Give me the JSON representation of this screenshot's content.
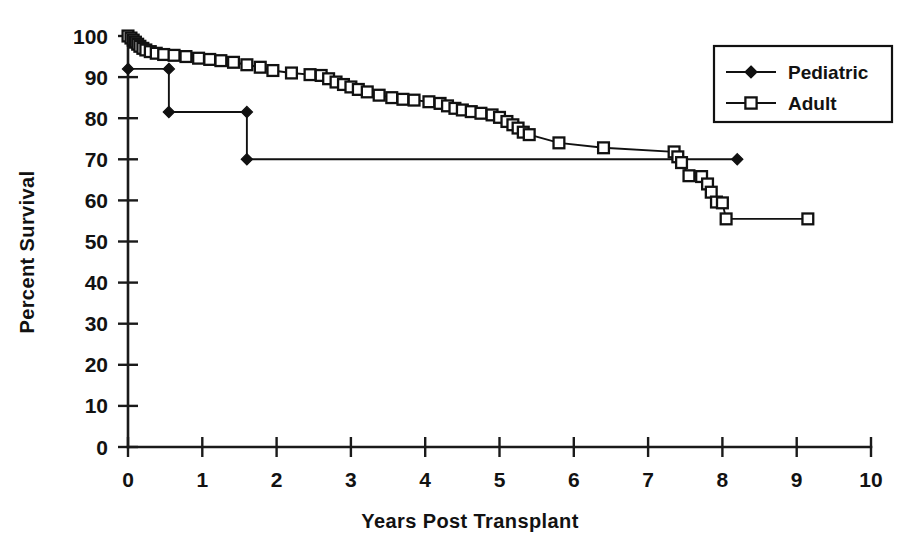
{
  "chart_data": {
    "type": "line",
    "title": "",
    "subtitle": "",
    "xlabel": "Years Post Transplant",
    "ylabel": "Percent Survival",
    "xlim": [
      0,
      10
    ],
    "ylim": [
      0,
      100
    ],
    "xticks": [
      0,
      1,
      2,
      3,
      4,
      5,
      6,
      7,
      8,
      9,
      10
    ],
    "yticks": [
      0,
      10,
      20,
      30,
      40,
      50,
      60,
      70,
      80,
      90,
      100
    ],
    "xtick_labels": [
      "0",
      "1",
      "2",
      "3",
      "4",
      "5",
      "6",
      "7",
      "8",
      "9",
      "10"
    ],
    "ytick_labels": [
      "0",
      "10",
      "20",
      "30",
      "40",
      "50",
      "60",
      "70",
      "80",
      "90",
      "100"
    ],
    "grid": false,
    "legend_position": "top-right",
    "style": "kaplan-meier step curve, black and white",
    "series": [
      {
        "name": "Pediatric",
        "marker": "filled-diamond",
        "color": "#111111",
        "points": [
          [
            0.0,
            92.0
          ],
          [
            0.55,
            92.0
          ],
          [
            0.55,
            81.5
          ],
          [
            1.6,
            81.5
          ],
          [
            1.6,
            70.0
          ],
          [
            8.2,
            70.0
          ]
        ],
        "censor_markers": [
          [
            0.0,
            92.0
          ],
          [
            0.55,
            92.0
          ],
          [
            0.55,
            81.5
          ],
          [
            1.6,
            81.5
          ],
          [
            1.6,
            70.0
          ],
          [
            8.2,
            70.0
          ]
        ]
      },
      {
        "name": "Adult",
        "marker": "open-square",
        "color": "#111111",
        "points": [
          [
            0.0,
            100.0
          ],
          [
            0.04,
            99.5
          ],
          [
            0.07,
            99.0
          ],
          [
            0.1,
            98.5
          ],
          [
            0.13,
            98.0
          ],
          [
            0.16,
            97.5
          ],
          [
            0.2,
            97.0
          ],
          [
            0.24,
            96.6
          ],
          [
            0.3,
            96.2
          ],
          [
            0.38,
            95.8
          ],
          [
            0.48,
            95.5
          ],
          [
            0.62,
            95.3
          ],
          [
            0.78,
            95.0
          ],
          [
            0.95,
            94.6
          ],
          [
            1.1,
            94.3
          ],
          [
            1.25,
            94.0
          ],
          [
            1.42,
            93.6
          ],
          [
            1.6,
            93.0
          ],
          [
            1.78,
            92.4
          ],
          [
            1.95,
            91.6
          ],
          [
            2.2,
            91.0
          ],
          [
            2.45,
            90.6
          ],
          [
            2.6,
            90.4
          ],
          [
            2.7,
            89.6
          ],
          [
            2.8,
            88.8
          ],
          [
            2.9,
            88.2
          ],
          [
            3.0,
            87.6
          ],
          [
            3.1,
            87.0
          ],
          [
            3.22,
            86.4
          ],
          [
            3.38,
            85.6
          ],
          [
            3.55,
            85.0
          ],
          [
            3.7,
            84.6
          ],
          [
            3.85,
            84.4
          ],
          [
            4.05,
            84.0
          ],
          [
            4.2,
            83.6
          ],
          [
            4.3,
            83.0
          ],
          [
            4.4,
            82.4
          ],
          [
            4.5,
            82.0
          ],
          [
            4.62,
            81.6
          ],
          [
            4.75,
            81.2
          ],
          [
            4.9,
            80.8
          ],
          [
            5.0,
            80.2
          ],
          [
            5.1,
            79.2
          ],
          [
            5.18,
            78.4
          ],
          [
            5.25,
            77.6
          ],
          [
            5.32,
            76.6
          ],
          [
            5.4,
            76.0
          ],
          [
            5.8,
            74.0
          ],
          [
            6.4,
            72.8
          ],
          [
            7.35,
            71.8
          ],
          [
            7.4,
            70.6
          ],
          [
            7.45,
            69.2
          ],
          [
            7.55,
            66.0
          ],
          [
            7.72,
            65.8
          ],
          [
            7.8,
            64.0
          ],
          [
            7.85,
            62.0
          ],
          [
            7.92,
            59.6
          ],
          [
            8.0,
            59.4
          ],
          [
            8.05,
            55.5
          ],
          [
            9.15,
            55.5
          ]
        ],
        "key_values": {
          "1_year": 94.0,
          "3_year": 87.6,
          "5_year": 80.2,
          "7_year": 72.0,
          "8_year": 59.0,
          "final": 55.5
        }
      }
    ],
    "annotations": []
  },
  "legend": {
    "entries": [
      {
        "label": "Pediatric",
        "marker": "filled-diamond"
      },
      {
        "label": "Adult",
        "marker": "open-square"
      }
    ]
  },
  "axes": {
    "y_title": "Percent Survival",
    "x_title": "Years Post Transplant"
  }
}
